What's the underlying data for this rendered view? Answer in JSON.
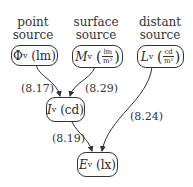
{
  "headers": [
    {
      "line1": "point",
      "line2": "source"
    },
    {
      "line1": "surface",
      "line2": "source"
    },
    {
      "line1": "distant",
      "line2": "source"
    }
  ],
  "nodes": {
    "flux": {
      "symbol": "Φ",
      "subscript": "v",
      "unit": "lm"
    },
    "exitance": {
      "symbol": "M",
      "subscript": "v",
      "unit_num": "lm",
      "unit_den": "m²"
    },
    "luminance": {
      "symbol": "L",
      "subscript": "v",
      "unit_num": "cd",
      "unit_den": "m²"
    },
    "intensity": {
      "symbol": "I",
      "subscript": "v",
      "unit": "cd"
    },
    "illuminance": {
      "symbol": "E",
      "subscript": "v",
      "unit": "lx"
    }
  },
  "edges": [
    {
      "from": "flux",
      "to": "intensity",
      "label": "(8.17)"
    },
    {
      "from": "exitance",
      "to": "intensity",
      "label": "(8.29)"
    },
    {
      "from": "intensity",
      "to": "illuminance",
      "label": "(8.19)"
    },
    {
      "from": "luminance",
      "to": "illuminance",
      "label": "(8.24)"
    }
  ]
}
